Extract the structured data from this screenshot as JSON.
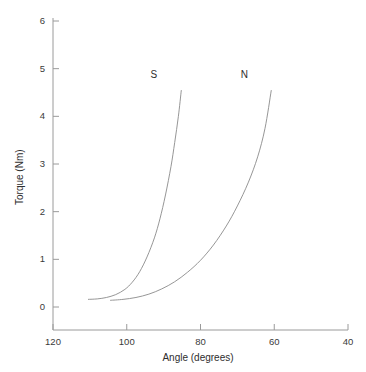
{
  "chart_data": {
    "type": "line",
    "title": "",
    "xlabel": "Angle (degrees)",
    "ylabel": "Torque (Nm)",
    "xlim": [
      120,
      40
    ],
    "ylim": [
      0,
      6
    ],
    "x_reversed": true,
    "grid": false,
    "legend_position": "inline-annotation",
    "xticks": [
      120,
      100,
      80,
      60,
      40
    ],
    "xtick_labels": [
      "120",
      "100",
      "80",
      "60",
      "40"
    ],
    "yticks": [
      0,
      1,
      2,
      3,
      4,
      5,
      6
    ],
    "ytick_labels": [
      "0",
      "1",
      "2",
      "3",
      "4",
      "5",
      "6"
    ],
    "line_color": "#8a8a8a",
    "axis_color": "#9a9a9a",
    "series": [
      {
        "name": "S",
        "label": "S",
        "label_angle": 92.5,
        "label_torque": 4.85,
        "x": [
          110.5,
          108.0,
          105.5,
          103.0,
          100.5,
          98.5,
          96.5,
          94.5,
          92.5,
          91.0,
          89.5,
          88.0,
          87.0,
          86.0,
          85.2
        ],
        "y": [
          0.16,
          0.17,
          0.2,
          0.26,
          0.37,
          0.52,
          0.74,
          1.05,
          1.45,
          1.85,
          2.35,
          2.95,
          3.45,
          4.0,
          4.55
        ]
      },
      {
        "name": "N",
        "label": "N",
        "label_angle": 68.0,
        "label_torque": 4.85,
        "x": [
          104.5,
          101.0,
          97.5,
          94.0,
          90.5,
          87.0,
          83.5,
          80.0,
          76.5,
          73.0,
          70.0,
          67.0,
          64.5,
          62.5,
          60.8
        ],
        "y": [
          0.14,
          0.16,
          0.2,
          0.27,
          0.38,
          0.53,
          0.73,
          0.98,
          1.3,
          1.7,
          2.12,
          2.62,
          3.15,
          3.75,
          4.55
        ]
      }
    ]
  },
  "axes": {
    "x_title": "Angle (degrees)",
    "y_title": "Torque (Nm)"
  }
}
